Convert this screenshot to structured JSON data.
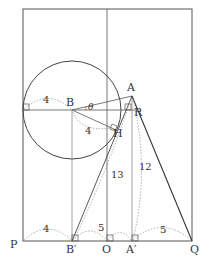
{
  "diagram": {
    "type": "geometry-figure",
    "points": {
      "A": {
        "label": "A",
        "x": 132,
        "y": 96
      },
      "B": {
        "label": "B",
        "x": 72,
        "y": 110
      },
      "H": {
        "label": "H",
        "x": 115,
        "y": 127
      },
      "R": {
        "label": "R",
        "x": 134,
        "y": 109
      },
      "P": {
        "label": "P",
        "x": 23,
        "y": 241
      },
      "B_prime": {
        "label": "B′",
        "x": 72,
        "y": 241
      },
      "O": {
        "label": "O",
        "x": 107,
        "y": 241
      },
      "A_prime": {
        "label": "A′",
        "x": 132,
        "y": 241
      },
      "Q": {
        "label": "Q",
        "x": 192,
        "y": 241
      }
    },
    "angle_label": "θ",
    "measurements": {
      "radius_horizontal": "4",
      "radius_BH": "4",
      "AB_prime": "13",
      "AA_prime": "12",
      "PB_prime": "4",
      "OA_prime": "5",
      "A_prime_Q": "5"
    },
    "colors": {
      "stroke": "#444444",
      "dotted": "#999999",
      "background": "#ffffff"
    }
  }
}
